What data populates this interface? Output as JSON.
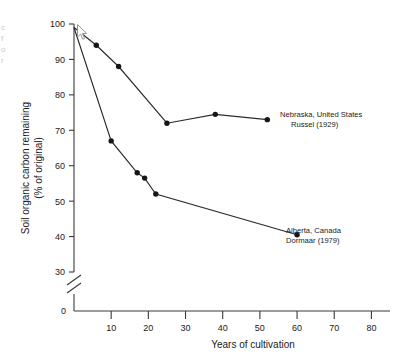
{
  "figure": {
    "ghost_left_fragment": "c\nf\no\nr",
    "ghost_top_fragment": "· ·· ·   · ·· ·"
  },
  "chart_data": {
    "type": "line",
    "title": "",
    "xlabel": "Years of cultivation",
    "ylabel": "Soil organic carbon remaining\n(% of original)",
    "ylabel_line1": "Soil organic carbon remaining",
    "ylabel_line2": "(% of original)",
    "xlim": [
      0,
      85
    ],
    "ylim": [
      30,
      100
    ],
    "y_axis_break": true,
    "y_break_between": [
      0,
      30
    ],
    "y_origin_label": "0",
    "grid": false,
    "legend_position": "inline-right",
    "xticks": [
      10,
      20,
      30,
      40,
      50,
      60,
      70,
      80
    ],
    "xtick_labels": [
      "10",
      "20",
      "30",
      "40",
      "50",
      "60",
      "70",
      "80"
    ],
    "yticks": [
      30,
      40,
      50,
      60,
      70,
      80,
      90,
      100
    ],
    "ytick_labels": [
      "30",
      "40",
      "50",
      "60",
      "70",
      "80",
      "90",
      "100"
    ],
    "series": [
      {
        "name": "Nebraska, United States",
        "source": "Russel (1929)",
        "label_line1": "Nebraska, United States",
        "label_line2": "Russel (1929)",
        "marker": "filled-circle",
        "x": [
          0,
          6,
          12,
          25,
          38,
          52
        ],
        "y": [
          99,
          94,
          88,
          72,
          74.5,
          73
        ]
      },
      {
        "name": "Alberta, Canada",
        "source": "Dormaar (1979)",
        "label_line1": "Alberta, Canada",
        "label_line2": "Dormaar (1979)",
        "marker": "filled-circle",
        "x": [
          0,
          10,
          17,
          19,
          22,
          60
        ],
        "y": [
          99,
          67,
          58,
          56.5,
          52,
          40.5
        ]
      }
    ]
  }
}
